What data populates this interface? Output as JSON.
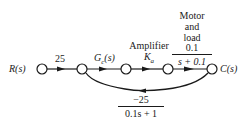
{
  "diagram": {
    "type": "signal-flow-graph",
    "nodes": [
      {
        "id": "R",
        "label": "R(s)"
      },
      {
        "id": "n2",
        "label": ""
      },
      {
        "id": "n3",
        "label": ""
      },
      {
        "id": "n4",
        "label": ""
      },
      {
        "id": "C",
        "label": "C(s)"
      }
    ],
    "branches": [
      {
        "from": "R",
        "to": "n2",
        "gain": "25"
      },
      {
        "from": "n2",
        "to": "n3",
        "gain": "Gc(s)",
        "gain_main": "G",
        "gain_sub": "c",
        "gain_tail": "(s)"
      },
      {
        "from": "n3",
        "to": "n4",
        "gain": "Ka",
        "gain_main": "K",
        "gain_sub": "a",
        "title": "Amplifier"
      },
      {
        "from": "n4",
        "to": "C",
        "gain": "0.1/(s + 0.1)",
        "numerator": "0.1",
        "denominator": "s + 0.1",
        "title_lines": [
          "Motor",
          "and",
          "load"
        ]
      },
      {
        "from": "C",
        "to": "n2",
        "gain": "-25/(0.1s + 1)",
        "numerator": "−25",
        "denominator": "0.1s + 1",
        "kind": "feedback"
      }
    ],
    "labels": {
      "input": "R(s)",
      "output": "C(s)",
      "gain_r": "25",
      "gc_main": "G",
      "gc_sub": "c",
      "gc_tail": "(s)",
      "amp_title": "Amplifier",
      "ka_main": "K",
      "ka_sub": "a",
      "motor_line1": "Motor",
      "motor_line2": "and",
      "motor_line3": "load",
      "motor_num": "0.1",
      "motor_den": "s + 0.1",
      "fb_num": "−25",
      "fb_den": "0.1s + 1"
    }
  }
}
